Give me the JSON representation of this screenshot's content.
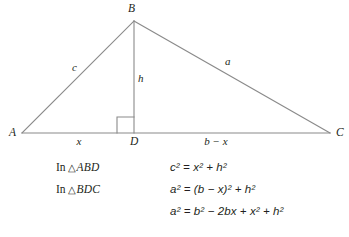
{
  "figure": {
    "type": "triangle-with-altitude",
    "stroke_color": "#8a8a8a",
    "text_color": "#231f20",
    "background_color": "#ffffff",
    "vertices": [
      {
        "name": "A",
        "label": "A",
        "x": 22,
        "y": 133
      },
      {
        "name": "B",
        "label": "B",
        "x": 134,
        "y": 21
      },
      {
        "name": "C",
        "label": "C",
        "x": 330,
        "y": 133
      },
      {
        "name": "D",
        "label": "D",
        "x": 134,
        "y": 133
      }
    ],
    "vertex_labels": [
      {
        "name": "vertex-label-a",
        "text": "A",
        "x": 9,
        "y": 128
      },
      {
        "name": "vertex-label-b",
        "text": "B",
        "x": 130,
        "y": 4
      },
      {
        "name": "vertex-label-c",
        "text": "C",
        "x": 337,
        "y": 128
      },
      {
        "name": "vertex-label-d",
        "text": "D",
        "x": 131,
        "y": 137
      }
    ],
    "side_labels": [
      {
        "name": "side-label-c",
        "text": "c",
        "x": 74,
        "y": 62
      },
      {
        "name": "side-label-a",
        "text": "a",
        "x": 227,
        "y": 56
      },
      {
        "name": "altitude-label-h",
        "text": "h",
        "x": 139,
        "y": 73
      },
      {
        "name": "segment-label-x",
        "text": "x",
        "x": 78,
        "y": 137
      },
      {
        "name": "segment-label-b-minus-x",
        "text": "b − x",
        "x": 215,
        "y": 137
      }
    ],
    "right_angle_marker": {
      "name": "right-angle-marker",
      "x": 117,
      "y": 117,
      "size": 16,
      "position": "left-of-altitude-on-base"
    }
  },
  "equations": {
    "rows": [
      {
        "name": "equation-row-abd",
        "triangle_prefix": "In",
        "triangle_symbol": "△",
        "triangle_name": "ABD",
        "equation": "c² = x² + h²"
      },
      {
        "name": "equation-row-bdc",
        "triangle_prefix": "In",
        "triangle_symbol": "△",
        "triangle_name": "BDC",
        "equation": "a² = (b − x)² + h²"
      },
      {
        "name": "equation-row-expanded",
        "triangle_prefix": "",
        "triangle_symbol": "",
        "triangle_name": "",
        "equation": "a² = b² − 2bx + x² + h²"
      }
    ]
  }
}
